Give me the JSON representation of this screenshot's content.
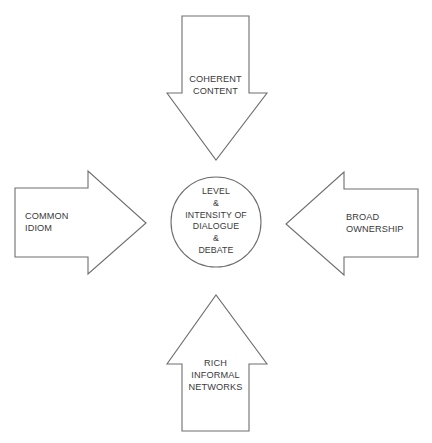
{
  "diagram": {
    "center": {
      "lines": [
        "LEVEL",
        "&",
        "INTENSITY OF",
        "DIALOGUE",
        "&",
        "DEBATE"
      ]
    },
    "arrows": [
      {
        "position": "top",
        "direction": "down",
        "lines": [
          "COHERENT",
          "CONTENT"
        ]
      },
      {
        "position": "left",
        "direction": "right",
        "lines": [
          "COMMON",
          "IDIOM"
        ]
      },
      {
        "position": "right",
        "direction": "left",
        "lines": [
          "BROAD",
          "OWNERSHIP"
        ]
      },
      {
        "position": "bottom",
        "direction": "up",
        "lines": [
          "RICH",
          "INFORMAL",
          "NETWORKS"
        ]
      }
    ],
    "colors": {
      "stroke": "#6e6e6e",
      "text": "#3a3a3a",
      "background": "#ffffff"
    }
  }
}
